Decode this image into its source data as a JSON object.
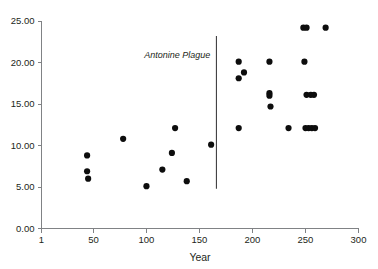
{
  "chart_data": {
    "type": "scatter",
    "title": "",
    "xlabel": "Year",
    "ylabel": "",
    "xlim": [
      1,
      300
    ],
    "ylim": [
      0.0,
      25.0
    ],
    "grid": false,
    "legend": null,
    "x_ticks": [
      1,
      50,
      100,
      150,
      200,
      250,
      300
    ],
    "x_tick_labels": [
      "1",
      "50",
      "100",
      "150",
      "200",
      "250",
      "300"
    ],
    "y_ticks": [
      0,
      5,
      10,
      15,
      20,
      25
    ],
    "y_tick_labels": [
      "0.00",
      "5.00",
      "10.00",
      "15.00",
      "20.00",
      "25.00"
    ],
    "annotations": [
      {
        "label": "Antonine Plague",
        "type": "vertical-line",
        "x": 166,
        "y_top": 23.2,
        "y_bottom": 4.8,
        "label_x": 163,
        "label_y": 20.6
      }
    ],
    "points": [
      {
        "x": 44,
        "y": 8.8
      },
      {
        "x": 44,
        "y": 6.9
      },
      {
        "x": 45,
        "y": 6.0
      },
      {
        "x": 78,
        "y": 10.8
      },
      {
        "x": 100,
        "y": 5.1
      },
      {
        "x": 115,
        "y": 7.1
      },
      {
        "x": 124,
        "y": 9.1
      },
      {
        "x": 127,
        "y": 12.1
      },
      {
        "x": 138,
        "y": 5.7
      },
      {
        "x": 161,
        "y": 10.1
      },
      {
        "x": 187,
        "y": 20.1
      },
      {
        "x": 192,
        "y": 18.8
      },
      {
        "x": 187,
        "y": 18.1
      },
      {
        "x": 187,
        "y": 12.1
      },
      {
        "x": 216,
        "y": 20.1
      },
      {
        "x": 216,
        "y": 16.3
      },
      {
        "x": 216,
        "y": 16.0
      },
      {
        "x": 217,
        "y": 14.7
      },
      {
        "x": 234,
        "y": 12.1
      },
      {
        "x": 248,
        "y": 24.2
      },
      {
        "x": 251,
        "y": 24.2
      },
      {
        "x": 269,
        "y": 24.2
      },
      {
        "x": 249,
        "y": 20.1
      },
      {
        "x": 251,
        "y": 16.1
      },
      {
        "x": 255,
        "y": 16.1
      },
      {
        "x": 258,
        "y": 16.1
      },
      {
        "x": 250,
        "y": 12.1
      },
      {
        "x": 253,
        "y": 12.1
      },
      {
        "x": 256,
        "y": 12.1
      },
      {
        "x": 259,
        "y": 12.1
      }
    ],
    "colors": {
      "point": "#0d0d0d",
      "axis": "#808285",
      "event_line": "#414042",
      "text": "#231f20",
      "background": "#ffffff"
    }
  }
}
